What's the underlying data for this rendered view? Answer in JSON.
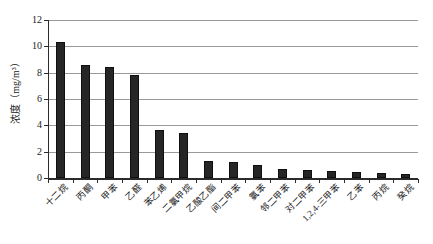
{
  "chart_data": {
    "type": "bar",
    "title": "",
    "subtitle": "",
    "xlabel": "",
    "ylabel": "浓度（mg/m³）",
    "ylim": [
      0,
      12
    ],
    "ytick_labels": [
      "12",
      "10",
      "8",
      "6",
      "4",
      "2",
      "0"
    ],
    "ytick_values": [
      12,
      10,
      8,
      6,
      4,
      2,
      0
    ],
    "grid": true,
    "legend": "none",
    "categories": [
      "十二烷",
      "丙酮",
      "甲苯",
      "乙醛",
      "苯乙烯",
      "二氯甲烷",
      "乙酸乙酯",
      "间二甲苯",
      "氯苯",
      "邻二甲苯",
      "对二甲苯",
      "1,2,4-三甲苯",
      "乙苯",
      "丙烷",
      "癸烷"
    ],
    "values": [
      10.3,
      8.6,
      8.4,
      7.85,
      3.65,
      3.45,
      1.3,
      1.2,
      1.0,
      0.65,
      0.6,
      0.55,
      0.45,
      0.35,
      0.3
    ],
    "units": "mg/m³",
    "bar_color": "#262626",
    "gridline_color": "#9a9a9a",
    "axis_color": "#2b2b2b",
    "background_color": "#ffffff"
  }
}
